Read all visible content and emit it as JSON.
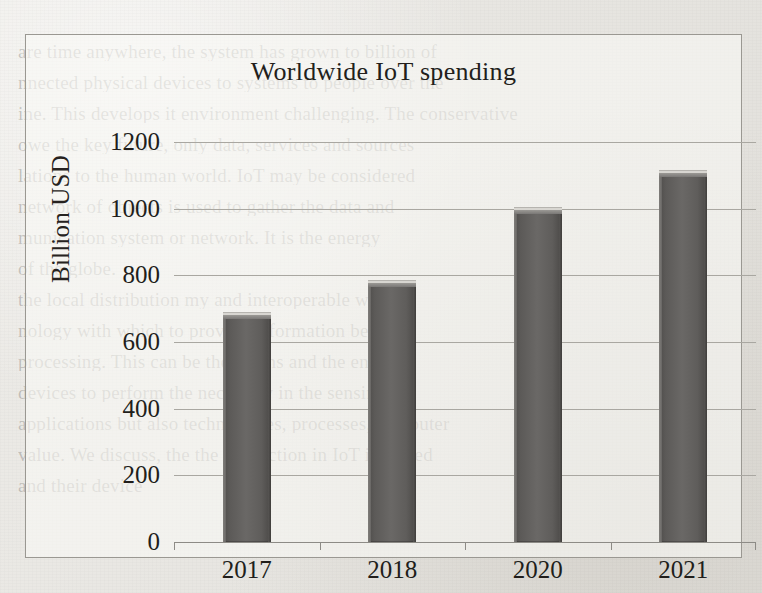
{
  "document": {
    "background_color": "#e9e7e2",
    "bleed_through_lines": [
      "are time anywhere, the system has grown to billion of",
      "nnected physical devices to systems to people over the",
      "ine. This develops it environment challenging. The conservative",
      "owe the key future, only data, services and sources",
      "lations to the human world. IoT may be considered",
      "network of objects is used to gather the data and",
      "munication system or network. It is the energy",
      "of the globe.",
      "the local distribution my and interoperable work",
      "nology with which to provide information between",
      "processing. This can be the means and the energy",
      "devices to perform the necessary in the sensing",
      "applications but also technologies, processes, computer",
      "value. We discuss, the the interaction in IoT involved",
      "and their device"
    ]
  },
  "chart_data": {
    "type": "bar",
    "title": "Worldwide IoT spending",
    "xlabel": "",
    "ylabel": "Billion USD",
    "categories": [
      "2017",
      "2018",
      "2020",
      "2021"
    ],
    "values": [
      690,
      786,
      1005,
      1116
    ],
    "ylim": [
      0,
      1200
    ],
    "ytick_labels": [
      "0",
      "200",
      "400",
      "600",
      "800",
      "1000",
      "1200"
    ],
    "ytick_values": [
      0,
      200,
      400,
      600,
      800,
      1000,
      1200
    ],
    "grid": true,
    "legend": false,
    "bar_color": "#5f5d5b",
    "axis_color": "#8d8b86",
    "grid_color": "#a9a7a1",
    "text_color": "#211e1b",
    "plot_background": "#faf9f6",
    "border_color": "#9a9892"
  }
}
